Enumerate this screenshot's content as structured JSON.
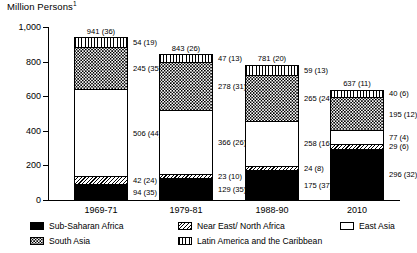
{
  "chart_data": {
    "type": "bar",
    "subtype": "stacked-vertical",
    "title": "Million Persons",
    "title_superscript": "1",
    "xlabel": "",
    "ylabel": "",
    "ylim": [
      0,
      1000
    ],
    "yticks": [
      0,
      200,
      400,
      600,
      800,
      1000
    ],
    "ytick_labels": [
      "0",
      "200",
      "400",
      "600",
      "800",
      "1,000"
    ],
    "grid": false,
    "legend_position": "bottom",
    "categories": [
      "1969-71",
      "1979-81",
      "1988-90",
      "2010"
    ],
    "totals": [
      941,
      843,
      781,
      637
    ],
    "total_labels": [
      "941 (36)",
      "843 (26)",
      "781 (20)",
      "637 (11)"
    ],
    "total_shares": [
      36,
      26,
      20,
      11
    ],
    "stack_order_bottom_to_top": [
      "Sub-Saharan Africa",
      "Near East/ North Africa",
      "East Asia",
      "South Asia",
      "Latin America and the Caribbean"
    ],
    "series": [
      {
        "name": "Sub-Saharan Africa",
        "key": "sub-saharan-africa",
        "pattern": "solid-black",
        "values": [
          94,
          129,
          175,
          296
        ],
        "shares": [
          35,
          35,
          37,
          32
        ],
        "labels": [
          "94 (35)",
          "129 (35)",
          "175 (37)",
          "296 (32)"
        ]
      },
      {
        "name": "Near East/ North Africa",
        "key": "near-east-north-africa",
        "pattern": "diagonal-hatch",
        "values": [
          42,
          23,
          24,
          29
        ],
        "shares": [
          24,
          10,
          8,
          6
        ],
        "labels": [
          "42 (24)",
          "23 (10)",
          "24 (8)",
          "29 (6)"
        ]
      },
      {
        "name": "East Asia",
        "key": "east-asia",
        "pattern": "white",
        "values": [
          506,
          366,
          258,
          77
        ],
        "shares": [
          44,
          26,
          16,
          4
        ],
        "labels": [
          "506 (44)",
          "366 (26)",
          "258 (16)",
          "77 (4)"
        ]
      },
      {
        "name": "South Asia",
        "key": "south-asia",
        "pattern": "dotted",
        "values": [
          245,
          278,
          265,
          195
        ],
        "shares": [
          35,
          31,
          24,
          12
        ],
        "labels": [
          "245 (35)",
          "278 (31)",
          "265 (24)",
          "195 (12)"
        ]
      },
      {
        "name": "Latin America and the Caribbean",
        "key": "latin-america-and-the-caribbean",
        "pattern": "vertical-stripes",
        "values": [
          54,
          47,
          59,
          40
        ],
        "shares": [
          19,
          13,
          13,
          6
        ],
        "labels": [
          "54 (19)",
          "47 (13)",
          "59 (13)",
          "40 (6)"
        ]
      }
    ],
    "legend": [
      {
        "label": "Sub-Saharan Africa",
        "key": "sub-saharan-africa"
      },
      {
        "label": "Near East/ North Africa",
        "key": "near-east-north-africa"
      },
      {
        "label": "East Asia",
        "key": "east-asia"
      },
      {
        "label": "South Asia",
        "key": "south-asia"
      },
      {
        "label": "Latin America and the Caribbean",
        "key": "latin-america-and-the-caribbean"
      }
    ]
  }
}
